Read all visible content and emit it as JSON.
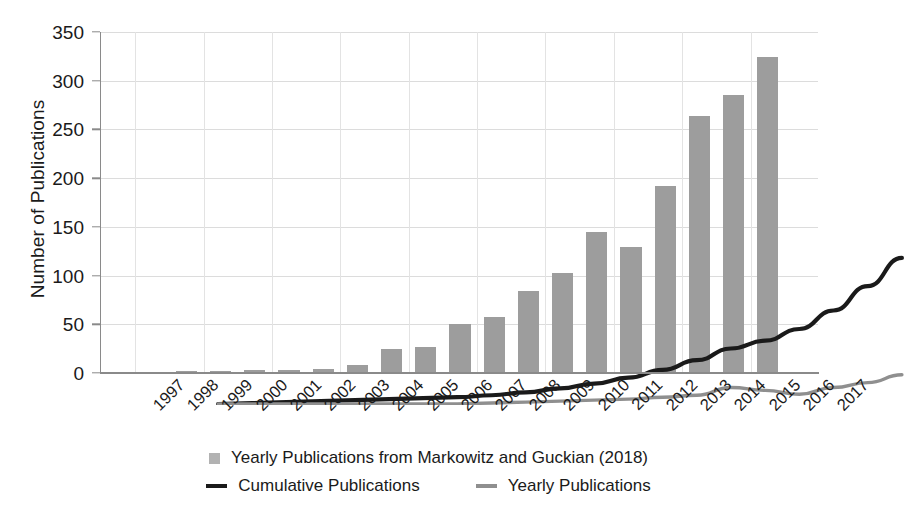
{
  "chart_data": {
    "type": "bar",
    "title": "",
    "xlabel": "",
    "ylabel": "Number of Publications",
    "ylim": [
      0,
      350
    ],
    "ytick_values": [
      0,
      50,
      100,
      150,
      200,
      250,
      300,
      350
    ],
    "ytick_labels": [
      "0",
      "50",
      "100",
      "150",
      "200",
      "250",
      "300",
      "350"
    ],
    "grid": true,
    "legend_position": "below",
    "categories": [
      "1997",
      "1998",
      "1999",
      "2000",
      "2001",
      "2002",
      "2003",
      "2004",
      "2005",
      "2006",
      "2007",
      "2008",
      "2009",
      "2010",
      "2011",
      "2012",
      "2013",
      "2014",
      "2015",
      "2016",
      "2017"
    ],
    "series": [
      {
        "name": "Yearly Publications from Markowitz and Guckian (2018)",
        "type": "bar",
        "color": "#9d9d9d",
        "values": [
          1,
          1,
          2,
          2,
          3,
          3,
          4,
          8,
          25,
          27,
          50,
          58,
          84,
          103,
          145,
          129,
          192,
          264,
          285,
          324,
          0
        ]
      },
      {
        "name": "Cumulative Publications",
        "type": "line",
        "color": "#1a1a1a",
        "values": [
          1,
          2,
          3,
          4,
          5,
          6,
          7,
          8,
          10,
          13,
          17,
          22,
          28,
          36,
          46,
          58,
          66,
          78,
          97,
          122,
          151
        ]
      },
      {
        "name": "Yearly Publications",
        "type": "line",
        "color": "#8f8f8f",
        "values": [
          1,
          1,
          1,
          1,
          1,
          1,
          1,
          1,
          2,
          3,
          4,
          5,
          6,
          8,
          10,
          18,
          15,
          11,
          18,
          23,
          31
        ]
      }
    ]
  },
  "legend": {
    "items": [
      {
        "label": "Yearly Publications from Markowitz and Guckian (2018)",
        "marker": "box",
        "color": "#b2b2b2"
      },
      {
        "label": "Cumulative Publications",
        "marker": "line",
        "color": "#1a1a1a"
      },
      {
        "label": "Yearly Publications",
        "marker": "line",
        "color": "#8f8f8f"
      }
    ]
  }
}
